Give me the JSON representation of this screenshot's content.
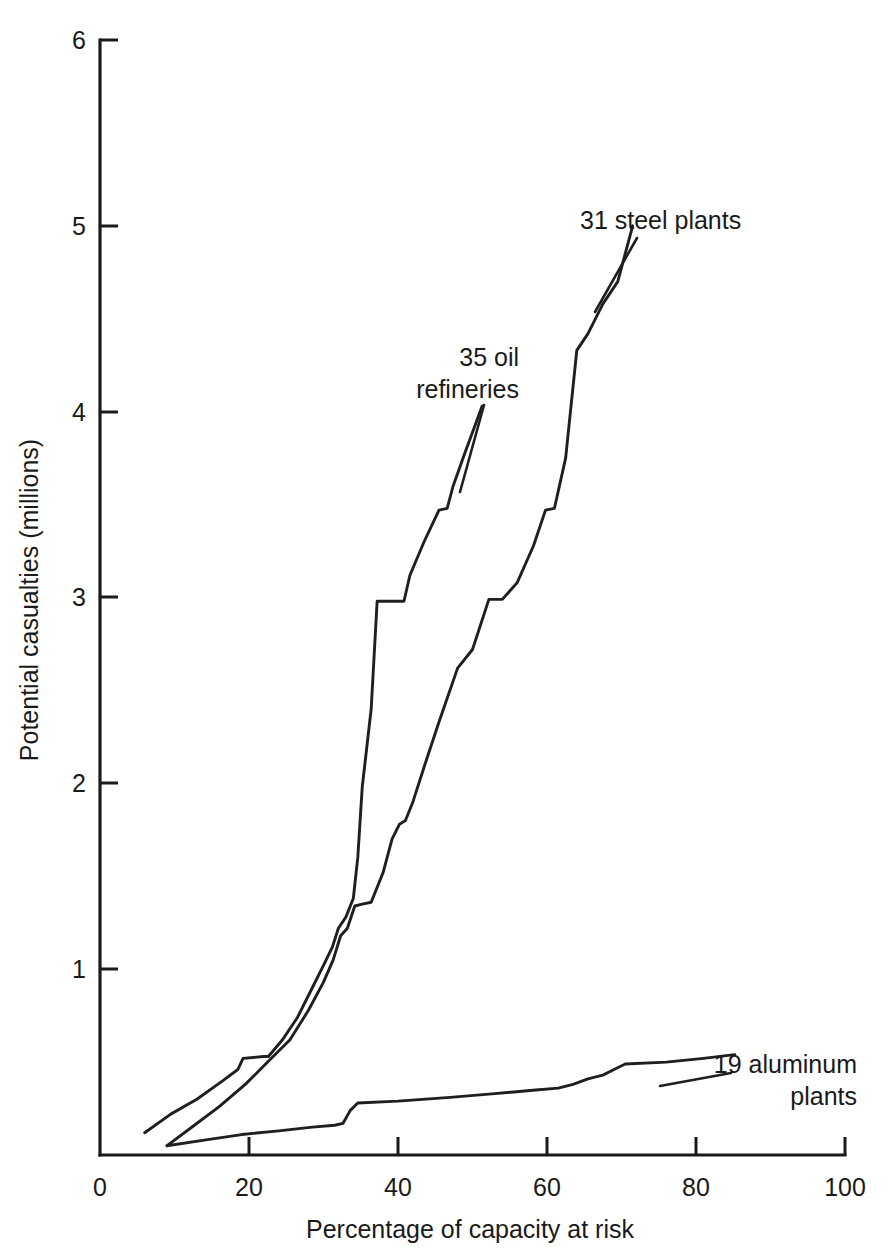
{
  "chart_data": {
    "type": "line",
    "title": "",
    "xlabel": "Percentage of capacity at risk",
    "ylabel": "Potential casualties (millions)",
    "xlim": [
      0,
      100
    ],
    "ylim": [
      0,
      6
    ],
    "xticks": [
      "0",
      "20",
      "40",
      "60",
      "80",
      "100"
    ],
    "xtick_values": [
      0,
      20,
      40,
      60,
      80,
      100
    ],
    "yticks": [
      "1",
      "2",
      "3",
      "4",
      "5",
      "6"
    ],
    "ytick_values": [
      1,
      2,
      3,
      4,
      5,
      6
    ],
    "grid": false,
    "legend_position": "inline-annotations",
    "series": [
      {
        "name": "35 oil refineries",
        "label": "35 oil refineries",
        "label_line1": "35 oil",
        "label_line2": "refineries",
        "x": [
          6.0,
          9.5,
          13.0,
          16.5,
          18.5,
          19.2,
          22.0,
          22.6,
          24.5,
          26.5,
          28.5,
          30.0,
          31.2,
          32.0,
          33.0,
          34.0,
          34.6,
          35.2,
          36.4,
          37.2,
          40.8,
          41.6,
          43.5,
          45.5,
          46.6,
          47.4,
          49.0,
          51.3
        ],
        "y": [
          0.12,
          0.22,
          0.3,
          0.4,
          0.46,
          0.52,
          0.53,
          0.53,
          0.62,
          0.74,
          0.9,
          1.02,
          1.12,
          1.22,
          1.28,
          1.38,
          1.6,
          1.98,
          2.4,
          2.98,
          2.98,
          3.12,
          3.3,
          3.47,
          3.48,
          3.6,
          3.78,
          4.03
        ]
      },
      {
        "name": "31 steel plants",
        "label": "31 steel plants",
        "x": [
          9.0,
          12.0,
          16.0,
          19.5,
          22.5,
          25.5,
          28.0,
          30.0,
          31.3,
          32.3,
          33.2,
          34.2,
          35.2,
          36.4,
          38.0,
          39.2,
          40.2,
          41.0,
          42.0,
          43.6,
          45.5,
          48.0,
          50.0,
          52.2,
          54.0,
          56.0,
          58.2,
          59.8,
          61.0,
          62.5,
          64.0,
          65.5,
          67.5,
          69.5,
          71.5
        ],
        "y": [
          0.05,
          0.14,
          0.26,
          0.38,
          0.5,
          0.62,
          0.78,
          0.93,
          1.05,
          1.18,
          1.22,
          1.34,
          1.35,
          1.36,
          1.52,
          1.7,
          1.78,
          1.8,
          1.9,
          2.1,
          2.33,
          2.62,
          2.72,
          2.99,
          2.99,
          3.08,
          3.28,
          3.47,
          3.48,
          3.75,
          4.33,
          4.42,
          4.58,
          4.7,
          5.0
        ]
      },
      {
        "name": "19 aluminum plants",
        "label": "19 aluminum plants",
        "label_line1": "19 aluminum",
        "label_line2": "plants",
        "x": [
          9.0,
          14.0,
          19.0,
          24.0,
          28.5,
          31.5,
          32.6,
          33.6,
          34.6,
          40.0,
          47.0,
          53.0,
          58.5,
          61.5,
          63.5,
          65.5,
          67.5,
          69.0,
          70.5,
          76.0,
          81.0,
          85.2
        ],
        "y": [
          0.05,
          0.08,
          0.11,
          0.13,
          0.15,
          0.16,
          0.17,
          0.24,
          0.28,
          0.29,
          0.31,
          0.33,
          0.35,
          0.36,
          0.38,
          0.41,
          0.43,
          0.46,
          0.49,
          0.5,
          0.52,
          0.54
        ]
      }
    ]
  },
  "axes": {
    "x_axis_title": "Percentage of capacity at risk",
    "y_axis_title": "Potential casualties (millions)",
    "x_tick_labels": [
      "0",
      "20",
      "40",
      "60",
      "80",
      "100"
    ],
    "y_tick_labels": [
      "1",
      "2",
      "3",
      "4",
      "5",
      "6"
    ]
  },
  "annotations": {
    "oil_line1": "35 oil",
    "oil_line2": "refineries",
    "steel": "31 steel plants",
    "aluminum_line1": "19 aluminum",
    "aluminum_line2": "plants"
  },
  "colors": {
    "ink": "#1a1a1a",
    "background": "#ffffff"
  }
}
